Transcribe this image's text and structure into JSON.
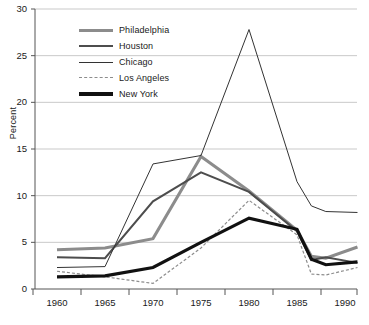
{
  "chart_data": {
    "type": "line",
    "title": "",
    "subtitle": "",
    "xlabel": "",
    "ylabel": "Percent",
    "xlim": [
      1960,
      1991.5
    ],
    "ylim": [
      0,
      30
    ],
    "yticks": [
      0,
      5,
      10,
      15,
      20,
      25,
      30
    ],
    "xticks": [
      1960,
      1965,
      1970,
      1975,
      1980,
      1985,
      1990
    ],
    "xtick_labels": [
      "1960",
      "1965",
      "1970",
      "1975",
      "1980",
      "1985",
      "1990"
    ],
    "ytick_labels": [
      "0",
      "5",
      "10",
      "15",
      "20",
      "25",
      "30"
    ],
    "grid": "horizontal",
    "legend_position": "upper-left-inside",
    "series": [
      {
        "name": "Philadelphia",
        "color": "#8c8c8c",
        "width": 3.0,
        "dash": "none",
        "x": [
          1960,
          1965,
          1970,
          1975,
          1980,
          1985,
          1986.5,
          1988,
          1991.3
        ],
        "values": [
          4.2,
          4.4,
          5.4,
          14.2,
          10.5,
          6.3,
          3.5,
          3.3,
          4.5
        ]
      },
      {
        "name": "Houston",
        "color": "#4d4d4d",
        "width": 2.0,
        "dash": "none",
        "x": [
          1960,
          1965,
          1970,
          1975,
          1980,
          1985,
          1986.5,
          1988,
          1991.3
        ],
        "values": [
          3.4,
          3.3,
          9.4,
          12.5,
          10.4,
          6.2,
          3.1,
          3.4,
          2.8
        ]
      },
      {
        "name": "Chicago",
        "color": "#333333",
        "width": 1.0,
        "dash": "none",
        "x": [
          1960,
          1965,
          1970,
          1975,
          1980,
          1985,
          1986.5,
          1988,
          1991.3
        ],
        "values": [
          2.3,
          2.4,
          13.4,
          14.3,
          27.8,
          11.5,
          8.9,
          8.3,
          8.2
        ]
      },
      {
        "name": "Los Angeles",
        "color": "#8c8c8c",
        "width": 1.2,
        "dash": "3,2",
        "x": [
          1960,
          1965,
          1970,
          1975,
          1980,
          1985,
          1986.5,
          1988,
          1991.3
        ],
        "values": [
          1.9,
          1.3,
          0.6,
          4.4,
          9.5,
          5.8,
          1.6,
          1.5,
          2.3
        ]
      },
      {
        "name": "New York",
        "color": "#111111",
        "width": 3.2,
        "dash": "none",
        "x": [
          1960,
          1965,
          1970,
          1975,
          1980,
          1985,
          1986.5,
          1988,
          1991.3
        ],
        "values": [
          1.3,
          1.4,
          2.3,
          5.0,
          7.6,
          6.4,
          3.2,
          2.6,
          2.9
        ]
      }
    ],
    "annotations": [
      {
        "text": "Houston spike",
        "series": "Houston",
        "x": 1986.8,
        "y": 8.9
      }
    ]
  },
  "legend": {
    "items": [
      {
        "label": "Philadelphia"
      },
      {
        "label": "Houston"
      },
      {
        "label": "Chicago"
      },
      {
        "label": "Los Angeles"
      },
      {
        "label": "New York"
      }
    ]
  }
}
